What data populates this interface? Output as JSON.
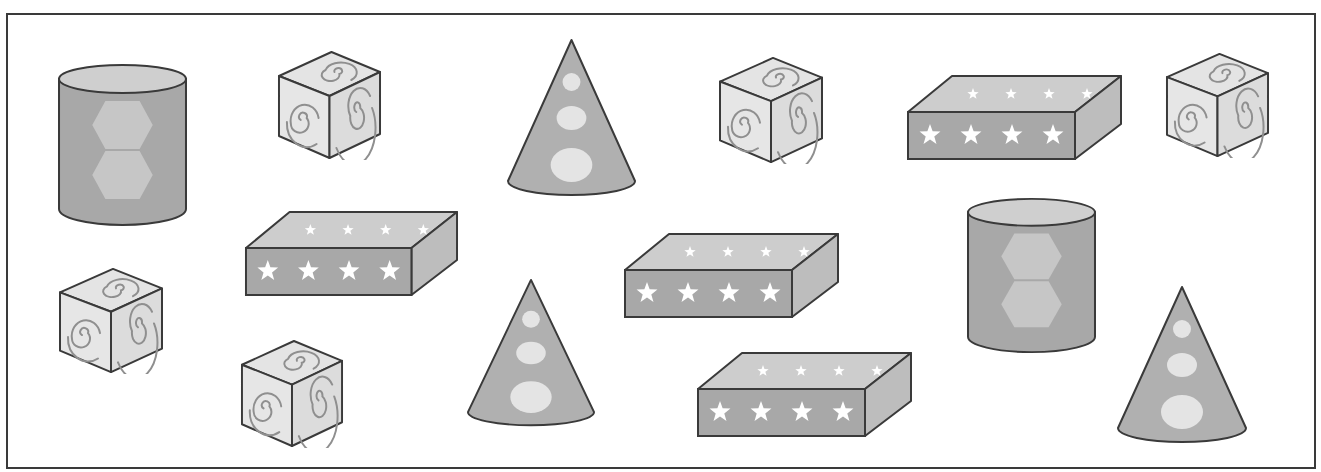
{
  "colors": {
    "outline": "#3a3a3a",
    "dark_fill": "#a8a8a8",
    "mid_fill": "#b4b4b4",
    "light_fill": "#cfcfcf",
    "cube_face": "#e4e4e4",
    "cube_side": "#dcdcdc",
    "spiral": "#8f8f8f",
    "decoration": "#eeeeee",
    "star": "#ffffff",
    "background": "#ffffff"
  },
  "counts": {
    "cylinder": 2,
    "cube": 5,
    "cone": 3,
    "rectangular_prism": 4,
    "total": 14
  },
  "shapes": [
    {
      "type": "cylinder",
      "pattern": "two hexagons",
      "x": 57,
      "y": 63,
      "w": 131,
      "h": 165
    },
    {
      "type": "cube",
      "pattern": "spirals",
      "x": 277,
      "y": 50,
      "w": 105,
      "h": 110
    },
    {
      "type": "cone",
      "pattern": "three dots",
      "x": 505,
      "y": 38,
      "w": 133,
      "h": 160
    },
    {
      "type": "cube",
      "pattern": "spirals",
      "x": 718,
      "y": 56,
      "w": 106,
      "h": 108
    },
    {
      "type": "rectangular_prism",
      "pattern": "stars",
      "x": 906,
      "y": 74,
      "w": 217,
      "h": 86
    },
    {
      "type": "cube",
      "pattern": "spirals",
      "x": 1165,
      "y": 52,
      "w": 105,
      "h": 106
    },
    {
      "type": "rectangular_prism",
      "pattern": "stars",
      "x": 244,
      "y": 210,
      "w": 215,
      "h": 86
    },
    {
      "type": "rectangular_prism",
      "pattern": "stars",
      "x": 623,
      "y": 232,
      "w": 217,
      "h": 86
    },
    {
      "type": "cylinder",
      "pattern": "two hexagons",
      "x": 966,
      "y": 197,
      "w": 131,
      "h": 158
    },
    {
      "type": "cube",
      "pattern": "spirals",
      "x": 58,
      "y": 267,
      "w": 106,
      "h": 107
    },
    {
      "type": "cube",
      "pattern": "spirals",
      "x": 240,
      "y": 339,
      "w": 104,
      "h": 109
    },
    {
      "type": "cone",
      "pattern": "three dots",
      "x": 465,
      "y": 278,
      "w": 132,
      "h": 150
    },
    {
      "type": "rectangular_prism",
      "pattern": "stars",
      "x": 696,
      "y": 351,
      "w": 217,
      "h": 86
    },
    {
      "type": "cone",
      "pattern": "three dots",
      "x": 1115,
      "y": 285,
      "w": 134,
      "h": 160
    }
  ]
}
